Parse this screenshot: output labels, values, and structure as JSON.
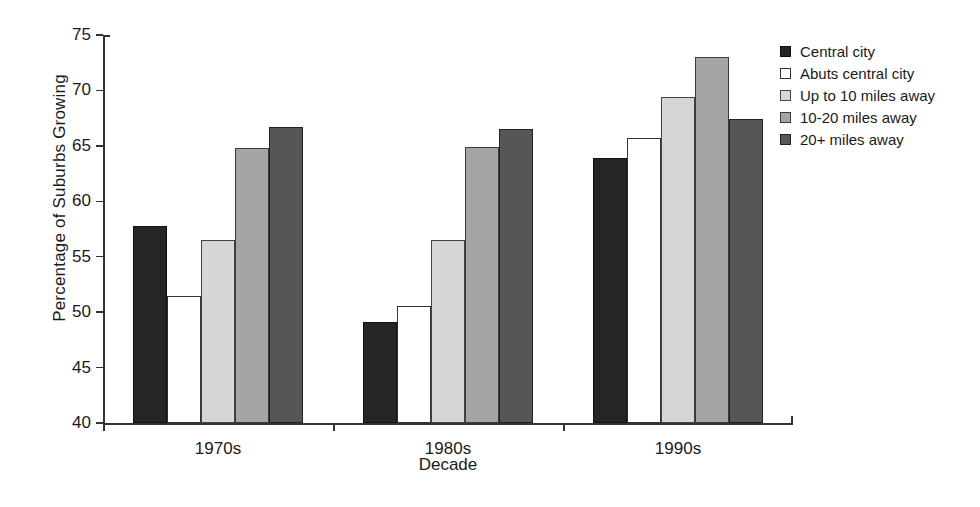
{
  "chart_data": {
    "type": "bar",
    "title": "",
    "xlabel": "Decade",
    "ylabel": "Percentage of Suburbs Growing",
    "categories": [
      "1970s",
      "1980s",
      "1990s"
    ],
    "series": [
      {
        "name": "Central city",
        "color": "#262626",
        "values": [
          57.8,
          49.1,
          63.9
        ]
      },
      {
        "name": "Abuts central city",
        "color": "#ffffff",
        "values": [
          51.5,
          50.6,
          65.7
        ]
      },
      {
        "name": "Up to 10 miles away",
        "color": "#d6d6d6",
        "values": [
          56.5,
          56.5,
          69.4
        ]
      },
      {
        "name": "10-20 miles away",
        "color": "#a5a5a5",
        "values": [
          64.8,
          64.9,
          73.0
        ]
      },
      {
        "name": "20+ miles away",
        "color": "#565656",
        "values": [
          66.7,
          66.5,
          67.4
        ]
      }
    ],
    "ylim": [
      40,
      75
    ],
    "yticks": [
      40,
      45,
      50,
      55,
      60,
      65,
      70,
      75
    ],
    "ytick_labels": [
      "40",
      "45",
      "50",
      "55",
      "60",
      "65",
      "70",
      "75"
    ],
    "grid": false,
    "legend_position": "right",
    "legend_entries": [
      "Central city",
      "Abuts central city",
      "Up to 10 miles away",
      "10-20 miles away",
      "20+ miles away"
    ]
  }
}
